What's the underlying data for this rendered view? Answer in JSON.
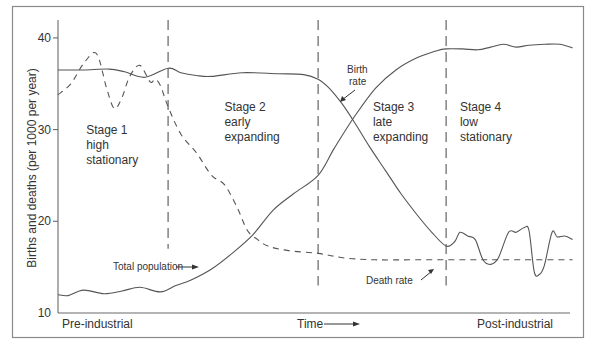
{
  "chart_data": {
    "type": "line",
    "title": "",
    "xlabel": "Time",
    "ylabel": "Births and deaths (per 1000 per year)",
    "ylim": [
      10,
      42
    ],
    "xlim": [
      0,
      100
    ],
    "yticks": [
      10,
      20,
      30,
      40
    ],
    "x_caption_left": "Pre-industrial",
    "x_caption_right": "Post-industrial",
    "grid": false,
    "stage_boundaries": [
      21.5,
      50.8,
      75.8
    ],
    "stage_boundaries_ymin": [
      17,
      13,
      13
    ],
    "stages": [
      {
        "name": "Stage 1",
        "lines": [
          "Stage 1",
          "high",
          "stationary"
        ],
        "x": 5.5,
        "y": 29.5
      },
      {
        "name": "Stage 2",
        "lines": [
          "Stage 2",
          "early",
          "expanding"
        ],
        "x": 32.5,
        "y": 32.0
      },
      {
        "name": "Stage 3",
        "lines": [
          "Stage 3",
          "late",
          "expanding"
        ],
        "x": 61.5,
        "y": 32.0
      },
      {
        "name": "Stage 4",
        "lines": [
          "Stage 4",
          "low",
          "stationary"
        ],
        "x": 78.5,
        "y": 32.0
      }
    ],
    "series": [
      {
        "name": "Birth rate",
        "style": "solid",
        "x": [
          0,
          5,
          10,
          13,
          17,
          21.5,
          24,
          27,
          30,
          36,
          43,
          48,
          50.8,
          53,
          55.5,
          58,
          61,
          64,
          67,
          70,
          73,
          75.8,
          77.5,
          78.5,
          80,
          81.5,
          83,
          84.5,
          86,
          88,
          89.5,
          91,
          92,
          93,
          94,
          95,
          96.5,
          97.5,
          99,
          100.5
        ],
        "values": [
          36.5,
          36.5,
          36.6,
          36.3,
          35.7,
          36.7,
          36.2,
          35.9,
          35.8,
          36.2,
          36.1,
          36.0,
          35.5,
          34.5,
          32.8,
          30.7,
          28.0,
          25.5,
          23.0,
          20.8,
          18.8,
          17.3,
          17.8,
          18.8,
          18.4,
          18.0,
          15.8,
          15.3,
          16.0,
          18.8,
          18.8,
          19.3,
          19.0,
          14.5,
          14.2,
          15.2,
          18.8,
          18.3,
          18.4,
          18.0
        ]
      },
      {
        "name": "Death rate",
        "style": "dashed",
        "x": [
          0,
          2.5,
          5,
          7.5,
          9.5,
          11,
          12.5,
          14,
          16,
          18,
          19,
          20,
          21.5,
          24,
          27,
          30,
          32.5,
          35,
          37,
          39,
          41,
          45,
          50.8,
          56,
          62,
          70,
          80,
          90,
          100.5
        ],
        "values": [
          33.8,
          35.0,
          37.2,
          38.3,
          34.5,
          32.3,
          33.5,
          35.8,
          37.0,
          35.2,
          35.5,
          34.8,
          32.5,
          29.5,
          27.5,
          25.0,
          24.0,
          21.5,
          19.0,
          18.0,
          17.3,
          16.8,
          16.5,
          16.0,
          15.8,
          15.8,
          15.8,
          15.8,
          15.8
        ]
      },
      {
        "name": "Total population",
        "style": "solid",
        "x": [
          0,
          2,
          5,
          9,
          12.5,
          16,
          20,
          23,
          26,
          30,
          34,
          38,
          42,
          46,
          50.8,
          54,
          58,
          62,
          66,
          70,
          74,
          75.8,
          79,
          82,
          84.5,
          87,
          89.5,
          92,
          95,
          98,
          100.5
        ],
        "values": [
          12.0,
          11.9,
          12.5,
          12.1,
          12.4,
          12.8,
          12.3,
          13.0,
          13.6,
          14.8,
          16.5,
          18.5,
          21.2,
          23.0,
          25.0,
          28.0,
          31.5,
          34.5,
          36.5,
          37.8,
          38.6,
          38.8,
          38.8,
          38.7,
          39.0,
          39.3,
          39.0,
          39.2,
          39.3,
          39.3,
          38.9
        ]
      }
    ],
    "annotations": [
      {
        "text_lines": [
          "Birth",
          "rate"
        ],
        "target_series": "Birth rate"
      },
      {
        "text_lines": [
          "Death rate"
        ],
        "target_series": "Death rate"
      },
      {
        "text_lines": [
          "Total population"
        ],
        "target_series": "Total population"
      }
    ],
    "y_tick_labels": [
      "10",
      "20",
      "30",
      "40"
    ]
  }
}
